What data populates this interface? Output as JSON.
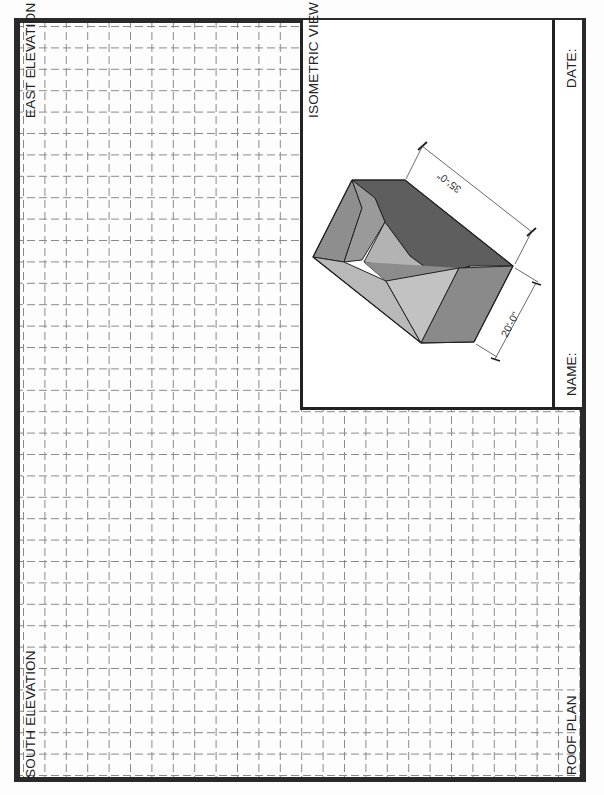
{
  "sheet": {
    "labels": {
      "east_elevation": "EAST ELEVATION",
      "south_elevation": "SOUTH ELEVATION",
      "isometric_view": "ISOMETRIC VIEW",
      "roof_plan": "ROOF PLAN",
      "name": "NAME:",
      "date": "DATE:"
    },
    "isometric": {
      "dimension_length": "35'-0\"",
      "dimension_width": "20'-0\""
    },
    "colors": {
      "frame": "#2a2a2a",
      "grid": "#8a8a8a",
      "roof_dark": "#5e5e5e",
      "roof_mid": "#8c8c8c",
      "roof_light": "#b3b3b3",
      "roof_lighter": "#c2c2c2"
    }
  }
}
